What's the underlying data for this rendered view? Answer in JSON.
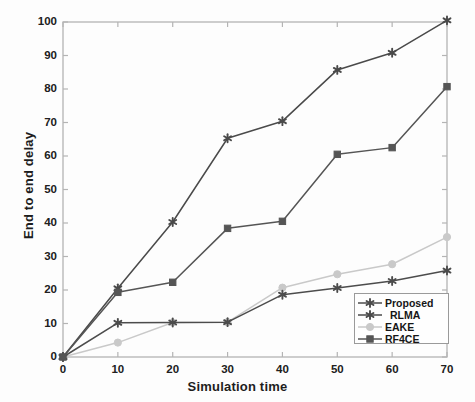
{
  "chart_data": {
    "type": "line",
    "title": "",
    "xlabel": "Simulation time",
    "ylabel": "End to end delay",
    "xlim": [
      0,
      70
    ],
    "ylim": [
      0,
      100
    ],
    "xticks": [
      0,
      10,
      20,
      30,
      40,
      50,
      60,
      70
    ],
    "yticks": [
      0,
      10,
      20,
      30,
      40,
      50,
      60,
      70,
      80,
      90,
      100
    ],
    "grid": false,
    "legend_position": "lower right",
    "x": [
      0,
      10,
      20,
      30,
      40,
      50,
      60,
      70
    ],
    "series": [
      {
        "name": "Proposed",
        "values": [
          0,
          10.2,
          10.3,
          10.4,
          18.6,
          20.6,
          22.7,
          25.8
        ],
        "color": "#4c4c4c",
        "marker": "asterisk"
      },
      {
        "name": "RLMA",
        "values": [
          0,
          20.5,
          40.3,
          65.3,
          70.4,
          85.7,
          90.8,
          100.5
        ],
        "color": "#4a4a4a",
        "marker": "asterisk"
      },
      {
        "name": "EAKE",
        "values": [
          0,
          4.3,
          10.3,
          10.4,
          20.7,
          24.7,
          27.7,
          35.8
        ],
        "color": "#c9c9c9",
        "marker": "circle"
      },
      {
        "name": "RF4CE",
        "values": [
          0,
          19.3,
          22.3,
          38.4,
          40.5,
          60.5,
          62.5,
          80.7
        ],
        "color": "#555555",
        "marker": "square"
      }
    ]
  },
  "legend": {
    "items": [
      {
        "label": "Proposed",
        "indent": false
      },
      {
        "label": "RLMA",
        "indent": true
      },
      {
        "label": "EAKE",
        "indent": false
      },
      {
        "label": "RF4CE",
        "indent": false
      }
    ]
  },
  "axes": {
    "x_label": "Simulation time",
    "y_label": "End to end delay",
    "x_tick_labels": [
      "0",
      "10",
      "20",
      "30",
      "40",
      "50",
      "60",
      "70"
    ],
    "y_tick_labels": [
      "0",
      "10",
      "20",
      "30",
      "40",
      "50",
      "60",
      "70",
      "80",
      "90",
      "100"
    ]
  },
  "colors": {
    "axis": "#b4b4b4",
    "text": "#1d1d1d",
    "background": "#fdfdfd"
  }
}
